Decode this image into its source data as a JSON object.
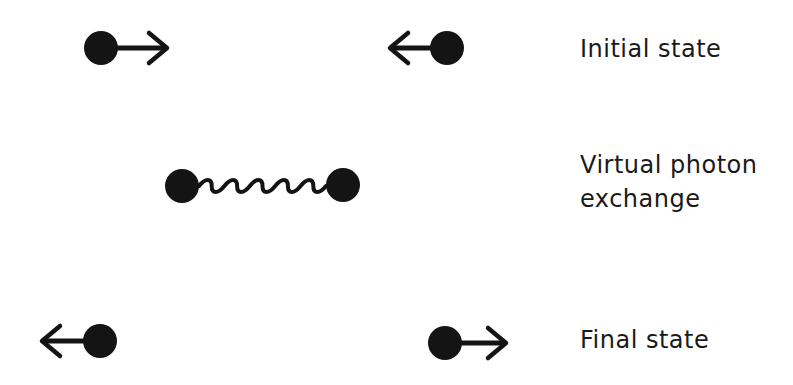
{
  "diagram": {
    "colors": {
      "ink": "#141414",
      "background": "#ffffff",
      "text": "#1a1a1a"
    },
    "stages": [
      {
        "id": "initial",
        "label": "Initial state",
        "particles": [
          {
            "cx": 101,
            "cy": 48,
            "r": 17,
            "arrow": "right",
            "arrow_tip_x": 167
          },
          {
            "cx": 447,
            "cy": 48,
            "r": 17,
            "arrow": "left",
            "arrow_tip_x": 390
          }
        ]
      },
      {
        "id": "virtual",
        "label_line1": "Virtual photon",
        "label_line2": "exchange",
        "particles": [
          {
            "cx": 182,
            "cy": 186,
            "r": 17
          },
          {
            "cx": 343,
            "cy": 185,
            "r": 17
          }
        ],
        "connector": {
          "type": "wavy-line",
          "represents": "photon",
          "from_x": 199,
          "to_x": 326,
          "y": 186,
          "humps": 5,
          "amplitude": 5
        }
      },
      {
        "id": "final",
        "label": "Final state",
        "particles": [
          {
            "cx": 100,
            "cy": 341,
            "r": 17,
            "arrow": "left",
            "arrow_tip_x": 42
          },
          {
            "cx": 445,
            "cy": 343,
            "r": 17,
            "arrow": "right",
            "arrow_tip_x": 506
          }
        ]
      }
    ]
  }
}
